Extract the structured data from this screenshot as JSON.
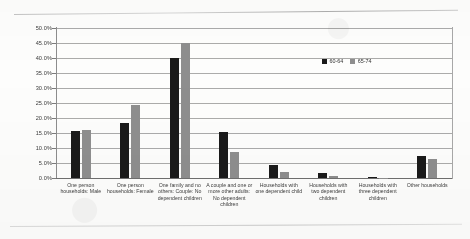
{
  "chart_data": {
    "type": "bar",
    "title": "",
    "xlabel": "",
    "ylabel": "",
    "ylim": [
      0,
      50
    ],
    "ytick_labels": [
      "50.0%",
      "45.0%",
      "40.0%",
      "35.0%",
      "30.0%",
      "25.0%",
      "20.0%",
      "15.0%",
      "10.0%",
      "5.0%",
      "0.0%"
    ],
    "ytick_values": [
      50,
      45,
      40,
      35,
      30,
      25,
      20,
      15,
      10,
      5,
      0
    ],
    "grid": true,
    "legend_position": "inside-top-right",
    "categories": [
      "One person households: Male",
      "One person households: Female",
      "One family and no others: Couple: No dependent children",
      "A couple and one or more other adults: No dependent children",
      "Households with one dependent child",
      "Households with two dependent children",
      "Households with three dependent children",
      "Other households"
    ],
    "series": [
      {
        "name": "60-64",
        "color": "#1a1a1a",
        "values": [
          15.8,
          18.2,
          40.1,
          15.2,
          4.2,
          1.6,
          0.2,
          7.2
        ]
      },
      {
        "name": "65-74",
        "color": "#8e8e8e",
        "values": [
          16.0,
          24.3,
          45.0,
          8.6,
          1.9,
          0.6,
          0.1,
          6.2
        ]
      }
    ]
  },
  "legend": {
    "items": [
      {
        "label": "60-64"
      },
      {
        "label": "65-74"
      }
    ]
  }
}
